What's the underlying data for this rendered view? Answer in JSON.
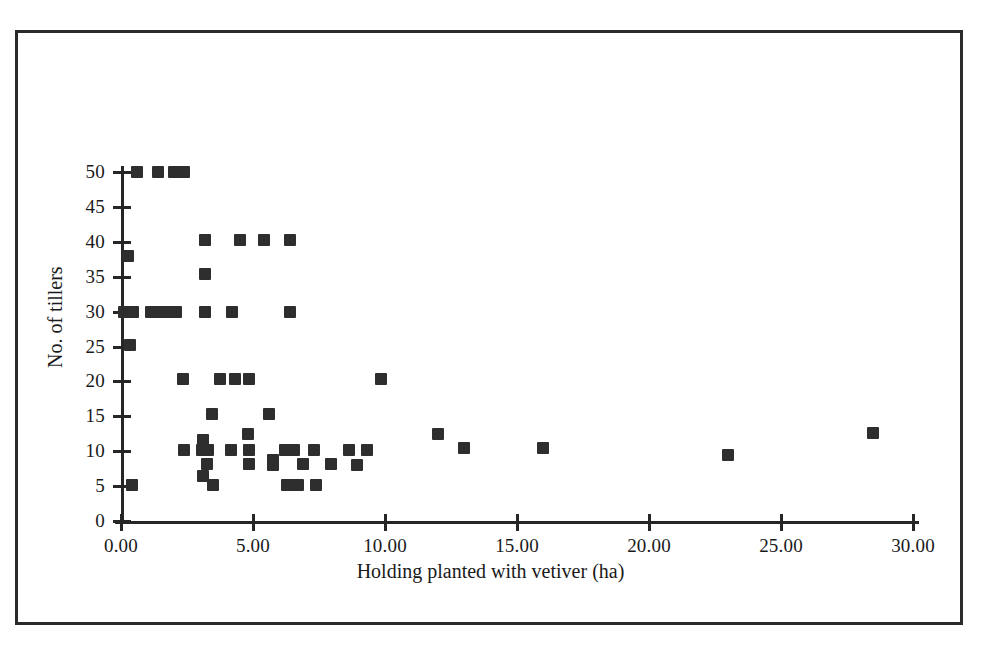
{
  "figure": {
    "border_color": "#2b2b2b",
    "marker_color": "#2e2e2e",
    "axis_color": "#262626"
  },
  "chart_data": {
    "type": "scatter",
    "title": "",
    "xlabel": "Holding planted with vetiver (ha)",
    "ylabel": "No. of tillers",
    "xlim": [
      0,
      30
    ],
    "ylim": [
      0,
      50
    ],
    "xticks": [
      0,
      5,
      10,
      15,
      20,
      25,
      30
    ],
    "xtick_labels": [
      "0.00",
      "5.00",
      "10.00",
      "15.00",
      "20.00",
      "25.00",
      "30.00"
    ],
    "yticks": [
      0,
      5,
      10,
      15,
      20,
      25,
      30,
      35,
      40,
      45,
      50
    ],
    "ytick_labels": [
      "0",
      "5",
      "10",
      "15",
      "20",
      "25",
      "30",
      "35",
      "40",
      "45",
      "50"
    ],
    "grid": false,
    "legend": null,
    "marker": "square",
    "points": [
      {
        "x": 0.6,
        "y": 50.0
      },
      {
        "x": 1.4,
        "y": 50.0
      },
      {
        "x": 2.0,
        "y": 50.0
      },
      {
        "x": 2.4,
        "y": 50.0
      },
      {
        "x": 0.25,
        "y": 38.0
      },
      {
        "x": 3.2,
        "y": 40.3
      },
      {
        "x": 4.5,
        "y": 40.3
      },
      {
        "x": 5.4,
        "y": 40.3
      },
      {
        "x": 6.4,
        "y": 40.3
      },
      {
        "x": 3.2,
        "y": 35.4
      },
      {
        "x": 0.1,
        "y": 30.0
      },
      {
        "x": 0.45,
        "y": 30.0
      },
      {
        "x": 1.15,
        "y": 30.0
      },
      {
        "x": 1.45,
        "y": 30.0
      },
      {
        "x": 1.65,
        "y": 30.0
      },
      {
        "x": 1.9,
        "y": 30.0
      },
      {
        "x": 2.1,
        "y": 30.0
      },
      {
        "x": 3.2,
        "y": 30.0
      },
      {
        "x": 4.2,
        "y": 30.0
      },
      {
        "x": 6.4,
        "y": 30.0
      },
      {
        "x": 0.35,
        "y": 25.2
      },
      {
        "x": 2.35,
        "y": 20.3
      },
      {
        "x": 3.75,
        "y": 20.3
      },
      {
        "x": 4.3,
        "y": 20.3
      },
      {
        "x": 4.85,
        "y": 20.3
      },
      {
        "x": 9.85,
        "y": 20.3
      },
      {
        "x": 3.45,
        "y": 15.3
      },
      {
        "x": 5.6,
        "y": 15.3
      },
      {
        "x": 4.8,
        "y": 12.4
      },
      {
        "x": 3.1,
        "y": 11.6
      },
      {
        "x": 12.0,
        "y": 12.4
      },
      {
        "x": 28.5,
        "y": 12.6
      },
      {
        "x": 2.4,
        "y": 10.2
      },
      {
        "x": 3.05,
        "y": 10.2
      },
      {
        "x": 3.3,
        "y": 10.2
      },
      {
        "x": 4.15,
        "y": 10.2
      },
      {
        "x": 4.85,
        "y": 10.2
      },
      {
        "x": 6.2,
        "y": 10.2
      },
      {
        "x": 6.55,
        "y": 10.2
      },
      {
        "x": 7.3,
        "y": 10.2
      },
      {
        "x": 8.65,
        "y": 10.2
      },
      {
        "x": 9.3,
        "y": 10.2
      },
      {
        "x": 13.0,
        "y": 10.4
      },
      {
        "x": 16.0,
        "y": 10.5
      },
      {
        "x": 23.0,
        "y": 9.5
      },
      {
        "x": 3.25,
        "y": 8.2
      },
      {
        "x": 4.85,
        "y": 8.2
      },
      {
        "x": 5.75,
        "y": 8.8
      },
      {
        "x": 5.75,
        "y": 8.0
      },
      {
        "x": 6.9,
        "y": 8.2
      },
      {
        "x": 7.95,
        "y": 8.2
      },
      {
        "x": 8.95,
        "y": 8.0
      },
      {
        "x": 3.1,
        "y": 6.4
      },
      {
        "x": 0.4,
        "y": 5.2
      },
      {
        "x": 3.5,
        "y": 5.2
      },
      {
        "x": 6.3,
        "y": 5.2
      },
      {
        "x": 6.7,
        "y": 5.2
      },
      {
        "x": 7.4,
        "y": 5.2
      }
    ]
  },
  "axes": {
    "x_title": "Holding planted with vetiver (ha)",
    "y_title": "No. of tillers"
  }
}
